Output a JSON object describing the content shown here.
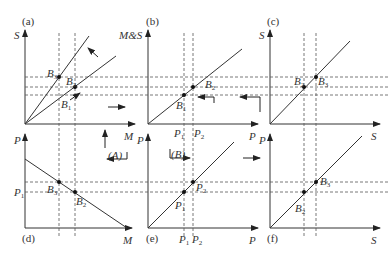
{
  "figure": {
    "panels": [
      {
        "id": "a",
        "tag": "(a)",
        "y_axis": "S",
        "x_axis": "M"
      },
      {
        "id": "b",
        "tag": "(b)",
        "y_axis": "M&S",
        "x_axis": "P"
      },
      {
        "id": "c",
        "tag": "(c)",
        "y_axis": "S",
        "x_axis": "S"
      },
      {
        "id": "d",
        "tag": "(d)",
        "y_axis": "P",
        "x_axis": "M"
      },
      {
        "id": "e",
        "tag": "(e)",
        "y_axis": "P",
        "x_axis": "P"
      },
      {
        "id": "f",
        "tag": "(f)",
        "y_axis": "P",
        "x_axis": "S"
      }
    ],
    "points": {
      "a": [
        "B3",
        "B2",
        "B1"
      ],
      "b": [
        "B2",
        "B1"
      ],
      "c": [
        "B2",
        "B3"
      ],
      "d": [
        "B3",
        "B2"
      ],
      "e": [
        "P2",
        "P1"
      ],
      "f": [
        "B3",
        "B2"
      ]
    },
    "tick_labels": {
      "b_x": [
        "P1",
        "P2"
      ],
      "d_y": [
        "P1"
      ],
      "e_x": [
        "P1",
        "P2"
      ]
    },
    "annotations": [
      "(A)",
      "(B)"
    ],
    "colors": {
      "line": "#333333",
      "dash": "#555555"
    }
  }
}
